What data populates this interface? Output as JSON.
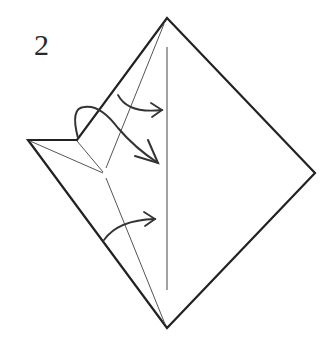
{
  "diagram": {
    "type": "origami-step",
    "step_number": "2",
    "colors": {
      "line": "#222222",
      "thin_line": "#555555",
      "background": "#ffffff"
    },
    "outline": [
      [
        167,
        18
      ],
      [
        315,
        173
      ],
      [
        167,
        328
      ],
      [
        28,
        140
      ],
      [
        77,
        140
      ]
    ],
    "folded_edge": [
      [
        77,
        140
      ],
      [
        167,
        18
      ]
    ],
    "creases": [
      {
        "name": "center-vertical-crease",
        "from": [
          167,
          47
        ],
        "to": [
          167,
          290
        ]
      },
      {
        "name": "left-flap-crease-top",
        "from": [
          28,
          140
        ],
        "to": [
          103,
          173
        ]
      },
      {
        "name": "notch-crease",
        "from": [
          77,
          140
        ],
        "to": [
          103,
          173
        ]
      },
      {
        "name": "diagonal-crease-upper",
        "from": [
          103,
          173
        ],
        "to": [
          163,
          24
        ]
      },
      {
        "name": "diagonal-crease-lower",
        "from": [
          105,
          178
        ],
        "to": [
          165,
          326
        ]
      }
    ],
    "arrows": [
      {
        "name": "upper-fold-arrow",
        "kind": "valley-fold"
      },
      {
        "name": "middle-wrap-arrow",
        "kind": "wrap-around"
      },
      {
        "name": "lower-fold-arrow",
        "kind": "valley-fold"
      }
    ]
  }
}
